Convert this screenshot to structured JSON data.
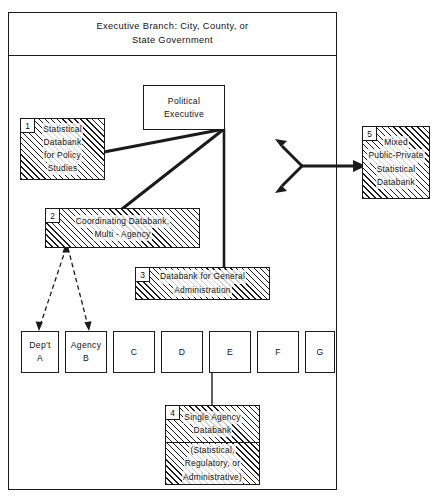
{
  "diagram": {
    "title": "Executive Branch: City, County, or State Government",
    "title_line1": "Executive Branch: City, County, or",
    "title_line2": "State Government"
  },
  "political_executive": {
    "line1": "Political",
    "line2": "Executive"
  },
  "databanks": [
    {
      "number": "1",
      "name": "statistical-databank-policy-studies",
      "lines": [
        "Statistical",
        "Databank",
        "for Policy",
        "Studies"
      ]
    },
    {
      "number": "2",
      "name": "coordinating-databank-multi-agency",
      "lines": [
        "Coordinating  Databank,",
        "Multi - Agency"
      ]
    },
    {
      "number": "3",
      "name": "databank-general-administration",
      "lines": [
        "Databank  for  General",
        "Administration"
      ]
    },
    {
      "number": "4",
      "name": "single-agency-databank",
      "lines_top": [
        "Single  Agency",
        "Databank"
      ],
      "lines_bottom": [
        "(Statistical,",
        "Regulatory, or",
        "Administrative)"
      ]
    },
    {
      "number": "5",
      "name": "mixed-public-private-statistical-databank",
      "lines": [
        "Mixed",
        "Public-Private",
        "Statistical",
        "Databank"
      ]
    }
  ],
  "agencies": [
    {
      "line1": "Dep't",
      "line2": "A"
    },
    {
      "line1": "Agency",
      "line2": "B"
    },
    {
      "line1": "",
      "line2": "C"
    },
    {
      "line1": "",
      "line2": "D"
    },
    {
      "line1": "",
      "line2": "E"
    },
    {
      "line1": "",
      "line2": "F"
    },
    {
      "line1": "",
      "line2": "G"
    }
  ],
  "colors": {
    "ink": "#1a1a1a",
    "paper": "#ffffff"
  }
}
